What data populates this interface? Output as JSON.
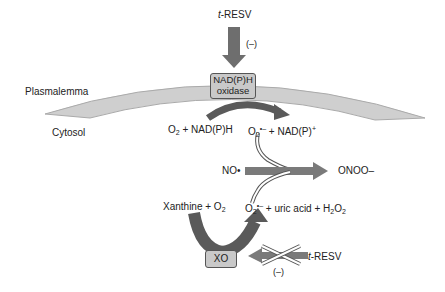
{
  "labels": {
    "resv_top": "t-RESV",
    "resv_top_prefix": "t",
    "resv_top_suffix": "-RESV",
    "inhibit_top": "(–)",
    "plasmalemma": "Plasmalemma",
    "cytosol": "Cytosol",
    "nadph_oxidase_line1": "NAD(P)H",
    "nadph_oxidase_line2": "oxidase",
    "reaction1_left": "O2 + NAD(P)H",
    "reaction1_right": "O2•– + NAD(P)+",
    "no_radical": "NO•",
    "peroxynitrite": "ONOO–",
    "reaction2_left": "Xanthine + O2",
    "reaction2_right": "O2•– + uric acid + H2O2",
    "xo": "XO",
    "resv_bottom_prefix": "t",
    "resv_bottom_suffix": "-RESV",
    "inhibit_bottom": "(–)"
  },
  "colors": {
    "arrow_fill": "#6e6e6e",
    "membrane_fill": "#cfcfcf",
    "membrane_edge": "#aaaaaa",
    "enzyme_box": "#c9c9c9"
  }
}
